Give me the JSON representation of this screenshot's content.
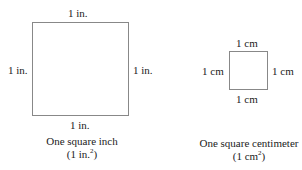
{
  "inch_square": {
    "top_label": "1 in.",
    "left_label": "1 in.",
    "right_label": "1 in.",
    "bottom_label": "1 in.",
    "caption_line1": "One square inch",
    "caption_line2_prefix": "(1 in.",
    "caption_line2_sup": "2",
    "caption_line2_suffix": ")"
  },
  "cm_square": {
    "top_label": "1 cm",
    "left_label": "1 cm",
    "right_label": "1 cm",
    "bottom_label": "1 cm",
    "caption_line1": "One square centimeter",
    "caption_line2_prefix": "(1 cm",
    "caption_line2_sup": "2",
    "caption_line2_suffix": ")"
  },
  "colors": {
    "outline": "#888888",
    "text": "#222222"
  }
}
